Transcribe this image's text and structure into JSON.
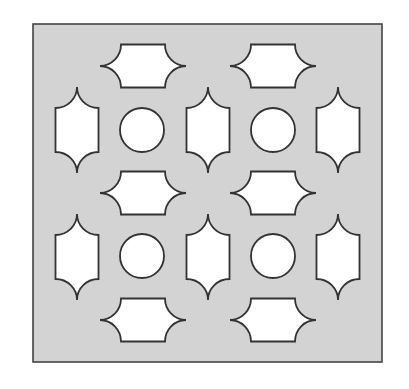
{
  "diagram": {
    "panel": {
      "x": 33,
      "y": 24,
      "width": 349,
      "height": 338,
      "fill": "#d3d3d3",
      "stroke": "#444444"
    },
    "cutout_fill": "#ffffff",
    "cutout_stroke": "#333333",
    "shape_size": {
      "long": 86,
      "short": 43,
      "flat": 44
    },
    "horizontal_shapes": [
      {
        "cx": 143,
        "cy": 66
      },
      {
        "cx": 273,
        "cy": 66
      },
      {
        "cx": 143,
        "cy": 193
      },
      {
        "cx": 273,
        "cy": 193
      },
      {
        "cx": 143,
        "cy": 320
      },
      {
        "cx": 273,
        "cy": 320
      }
    ],
    "vertical_shapes": [
      {
        "cx": 77,
        "cy": 130
      },
      {
        "cx": 208,
        "cy": 130
      },
      {
        "cx": 338,
        "cy": 130
      },
      {
        "cx": 77,
        "cy": 257
      },
      {
        "cx": 208,
        "cy": 257
      },
      {
        "cx": 338,
        "cy": 257
      }
    ],
    "circles": [
      {
        "cx": 142,
        "cy": 130,
        "r": 22
      },
      {
        "cx": 273,
        "cy": 130,
        "r": 22
      },
      {
        "cx": 142,
        "cy": 256,
        "r": 22
      },
      {
        "cx": 273,
        "cy": 256,
        "r": 22
      }
    ]
  }
}
